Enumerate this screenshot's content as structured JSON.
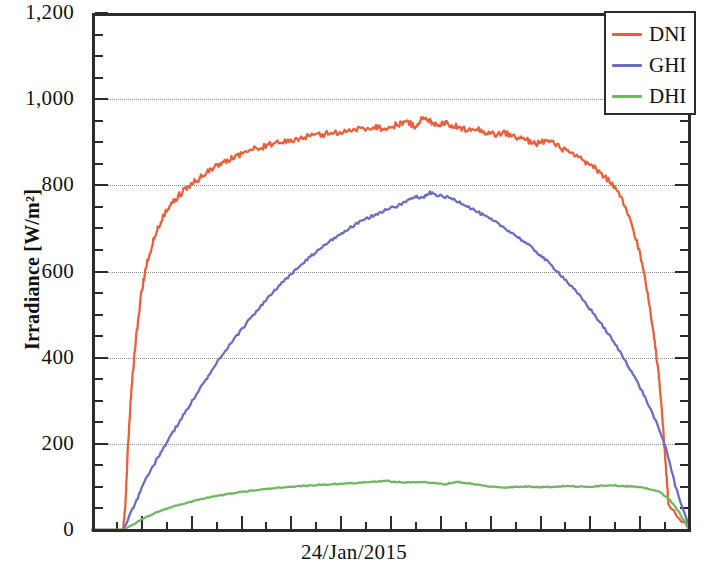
{
  "chart_data": {
    "type": "line",
    "title": "",
    "subtitle": "",
    "xlabel": "24/Jan/2015",
    "ylabel": "Irradiance [W/m²]",
    "ylim": [
      0,
      1200
    ],
    "ytick_labels": [
      "0",
      "200",
      "400",
      "600",
      "800",
      "1,000",
      "1,200"
    ],
    "ytick_values": [
      0,
      200,
      400,
      600,
      800,
      1000,
      1200
    ],
    "y_minor_tick_step": 50,
    "grid": "horizontal-dotted",
    "legend_position": "top-right",
    "x_axis_kind": "time-of-day",
    "x_tick_count": 25,
    "x_note": "single day, sunrise to sunset",
    "series": [
      {
        "name": "DNI",
        "color": "#E8613C",
        "peak_value": 955,
        "units": "W/m²",
        "x": [
          0.0,
          0.052,
          0.056,
          0.06,
          0.066,
          0.074,
          0.082,
          0.09,
          0.1,
          0.11,
          0.12,
          0.133,
          0.146,
          0.16,
          0.175,
          0.19,
          0.205,
          0.222,
          0.24,
          0.258,
          0.276,
          0.295,
          0.315,
          0.335,
          0.355,
          0.375,
          0.395,
          0.415,
          0.435,
          0.455,
          0.475,
          0.492,
          0.51,
          0.525,
          0.54,
          0.552,
          0.565,
          0.578,
          0.59,
          0.605,
          0.62,
          0.638,
          0.655,
          0.672,
          0.69,
          0.708,
          0.726,
          0.744,
          0.762,
          0.78,
          0.798,
          0.815,
          0.832,
          0.85,
          0.868,
          0.885,
          0.9,
          0.915,
          0.928,
          0.938,
          0.946,
          0.952,
          0.956,
          0.96,
          0.964,
          1.0
        ],
        "values": [
          0,
          0,
          60,
          190,
          330,
          450,
          545,
          610,
          660,
          700,
          730,
          755,
          778,
          795,
          812,
          828,
          842,
          856,
          868,
          878,
          886,
          893,
          899,
          905,
          911,
          916,
          920,
          924,
          928,
          932,
          936,
          930,
          941,
          948,
          937,
          955,
          949,
          941,
          946,
          938,
          930,
          934,
          925,
          918,
          922,
          912,
          905,
          898,
          904,
          890,
          876,
          862,
          848,
          830,
          806,
          770,
          720,
          650,
          560,
          470,
          380,
          300,
          215,
          140,
          60,
          0
        ]
      },
      {
        "name": "GHI",
        "color": "#6B6FC4",
        "peak_value": 783,
        "units": "W/m²",
        "x": [
          0.0,
          0.052,
          0.06,
          0.075,
          0.09,
          0.11,
          0.13,
          0.15,
          0.17,
          0.19,
          0.21,
          0.23,
          0.25,
          0.27,
          0.29,
          0.31,
          0.33,
          0.35,
          0.37,
          0.39,
          0.41,
          0.43,
          0.45,
          0.47,
          0.49,
          0.51,
          0.525,
          0.54,
          0.552,
          0.565,
          0.58,
          0.6,
          0.62,
          0.64,
          0.66,
          0.68,
          0.7,
          0.72,
          0.74,
          0.76,
          0.78,
          0.8,
          0.82,
          0.84,
          0.86,
          0.88,
          0.9,
          0.92,
          0.94,
          0.96,
          0.975,
          1.0
        ],
        "values": [
          0,
          0,
          25,
          70,
          118,
          168,
          215,
          260,
          305,
          348,
          390,
          428,
          465,
          500,
          532,
          562,
          590,
          616,
          640,
          662,
          682,
          700,
          716,
          730,
          742,
          752,
          762,
          776,
          770,
          783,
          776,
          770,
          758,
          742,
          726,
          710,
          692,
          672,
          650,
          625,
          598,
          568,
          536,
          500,
          462,
          420,
          374,
          322,
          262,
          190,
          105,
          0
        ]
      },
      {
        "name": "DHI",
        "color": "#6FB860",
        "peak_value": 115,
        "units": "W/m²",
        "x": [
          0.0,
          0.052,
          0.065,
          0.085,
          0.11,
          0.14,
          0.17,
          0.2,
          0.23,
          0.26,
          0.29,
          0.32,
          0.35,
          0.38,
          0.41,
          0.44,
          0.47,
          0.49,
          0.51,
          0.53,
          0.55,
          0.57,
          0.59,
          0.61,
          0.63,
          0.65,
          0.67,
          0.69,
          0.71,
          0.73,
          0.75,
          0.77,
          0.79,
          0.81,
          0.83,
          0.85,
          0.87,
          0.89,
          0.91,
          0.93,
          0.95,
          0.965,
          0.98,
          1.0
        ],
        "values": [
          0,
          0,
          10,
          26,
          42,
          56,
          68,
          77,
          84,
          90,
          95,
          99,
          102,
          105,
          107,
          109,
          112,
          114,
          111,
          110,
          112,
          109,
          106,
          112,
          108,
          104,
          100,
          99,
          100,
          101,
          100,
          100,
          102,
          101,
          100,
          103,
          104,
          102,
          100,
          96,
          88,
          72,
          45,
          0
        ]
      }
    ]
  },
  "legend": {
    "entries": [
      {
        "label": "DNI",
        "color": "#E8613C"
      },
      {
        "label": "GHI",
        "color": "#6B6FC4"
      },
      {
        "label": "DHI",
        "color": "#6FB860"
      }
    ]
  }
}
